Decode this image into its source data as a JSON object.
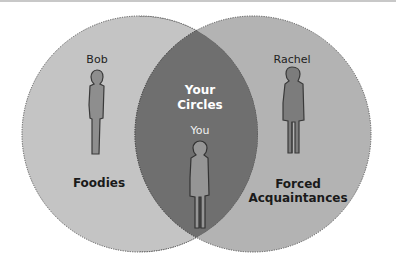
{
  "diagram": {
    "type": "venn",
    "colors": {
      "left_circle": "#c4c4c4",
      "right_circle": "#b3b3b3",
      "intersection": "#6f6f6f",
      "outline": "#555555",
      "person_fill": "#8a8a8a",
      "person_fill_dark": "#777777",
      "person_outline": "#3a3a3a"
    },
    "sets": [
      {
        "id": "left",
        "label": "Foodies",
        "person": "Bob"
      },
      {
        "id": "right",
        "label": "Forced Acquaintances",
        "label_line1": "Forced",
        "label_line2": "Acquaintances",
        "person": "Rachel"
      }
    ],
    "intersection": {
      "title_line1": "Your",
      "title_line2": "Circles",
      "person": "You"
    }
  }
}
